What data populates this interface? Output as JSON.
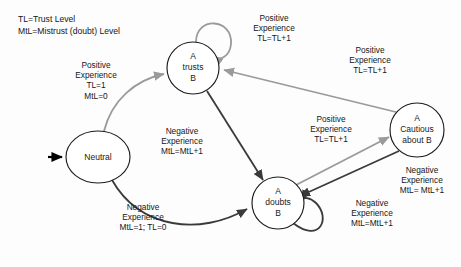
{
  "diagram": {
    "legend": {
      "line1": "TL=Trust Level",
      "line2": "MtL=Mistrust (doubt) Level"
    },
    "colors": {
      "positive_edge": "#9a9a9a",
      "negative_edge": "#3a3a3a",
      "node_stroke": "#1c1c1c",
      "start_arrow": "#000000",
      "background": "#fdfdfd",
      "text": "#161616"
    },
    "nodes": [
      {
        "id": "neutral",
        "label_lines": [
          "Neutral"
        ],
        "shape": "ellipse",
        "cx": 98,
        "cy": 157,
        "rx": 32,
        "ry": 26
      },
      {
        "id": "a-trusts-b",
        "label_lines": [
          "A",
          "trusts",
          "B"
        ],
        "shape": "circle",
        "cx": 193,
        "cy": 68,
        "rx": 26,
        "ry": 26
      },
      {
        "id": "a-doubts-b",
        "label_lines": [
          "A",
          "doubts",
          "B"
        ],
        "shape": "circle",
        "cx": 278,
        "cy": 203,
        "rx": 26,
        "ry": 26
      },
      {
        "id": "a-cautious-about-b",
        "label_lines": [
          "A",
          "Cautious",
          "about B"
        ],
        "shape": "circle",
        "cx": 417,
        "cy": 130,
        "rx": 27,
        "ry": 27
      }
    ],
    "edges": [
      {
        "id": "start-to-neutral",
        "from": "start",
        "to": "neutral",
        "kind": "start",
        "label_lines": []
      },
      {
        "id": "neutral-to-trusts",
        "from": "neutral",
        "to": "a-trusts-b",
        "kind": "positive",
        "label_lines": [
          "Positive",
          "Experience",
          "TL=1",
          "MtL=0"
        ]
      },
      {
        "id": "trusts-self-loop",
        "from": "a-trusts-b",
        "to": "a-trusts-b",
        "kind": "positive",
        "label_lines": [
          "Positive",
          "Experience",
          "TL=TL+1"
        ]
      },
      {
        "id": "trusts-to-doubts",
        "from": "a-trusts-b",
        "to": "a-doubts-b",
        "kind": "negative",
        "label_lines": [
          "Negative",
          "Experience",
          "MtL=MtL+1"
        ]
      },
      {
        "id": "neutral-to-doubts",
        "from": "neutral",
        "to": "a-doubts-b",
        "kind": "negative",
        "label_lines": [
          "Negative",
          "Experience",
          "MtL=1; TL=0"
        ]
      },
      {
        "id": "doubts-to-cautious",
        "from": "a-doubts-b",
        "to": "a-cautious-about-b",
        "kind": "positive",
        "label_lines": [
          "Positive",
          "Experience",
          "TL=TL+1"
        ]
      },
      {
        "id": "cautious-to-doubts",
        "from": "a-cautious-about-b",
        "to": "a-doubts-b",
        "kind": "negative",
        "label_lines": [
          "Negative",
          "Experience",
          "MtL= MtL+1"
        ]
      },
      {
        "id": "cautious-to-trusts",
        "from": "a-cautious-about-b",
        "to": "a-trusts-b",
        "kind": "positive",
        "label_lines": [
          "Positive",
          "Experience",
          "TL=TL+1"
        ]
      },
      {
        "id": "doubts-self-loop",
        "from": "a-doubts-b",
        "to": "a-doubts-b",
        "kind": "negative",
        "label_lines": [
          "Negative",
          "Experience",
          "MtL=MtL+1"
        ]
      }
    ]
  }
}
